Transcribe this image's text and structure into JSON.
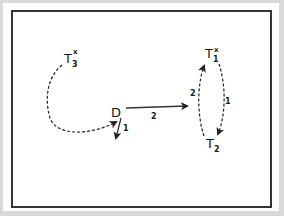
{
  "diagram": {
    "nodes": {
      "T3": {
        "base": "T",
        "sub": "3",
        "sup": "x"
      },
      "T1": {
        "base": "T",
        "sub": "1",
        "sup": "x"
      },
      "T2": {
        "base": "T",
        "sub": "2",
        "sup": ""
      },
      "D": {
        "base": "D",
        "sub": "",
        "sup": ""
      }
    },
    "edges": [
      {
        "id": "T3-to-D",
        "from": "T3",
        "to": "D",
        "style": "dashed",
        "label": ""
      },
      {
        "id": "D-down",
        "from": "D",
        "to": "",
        "style": "solid",
        "label": "1"
      },
      {
        "id": "D-to-T1T2",
        "from": "D",
        "to": "T1-T2",
        "style": "solid",
        "label": "2"
      },
      {
        "id": "T1-to-T2",
        "from": "T1",
        "to": "T2",
        "style": "dashed",
        "label": "1"
      },
      {
        "id": "T2-to-T1",
        "from": "T2",
        "to": "T1",
        "style": "dashed",
        "label": "2"
      }
    ]
  }
}
